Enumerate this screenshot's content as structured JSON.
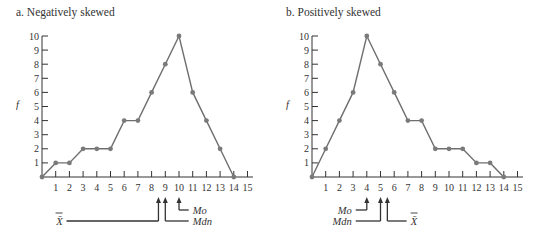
{
  "chart_data": [
    {
      "type": "line",
      "title": "a. Negatively skewed",
      "xlabel": "",
      "ylabel": "f",
      "x": [
        0,
        1,
        2,
        3,
        4,
        5,
        6,
        7,
        8,
        9,
        10,
        11,
        12,
        13,
        14
      ],
      "values": [
        0,
        1,
        1,
        2,
        2,
        2,
        4,
        4,
        6,
        8,
        10,
        6,
        4,
        2,
        0
      ],
      "xticks": [
        1,
        2,
        3,
        4,
        5,
        6,
        7,
        8,
        9,
        10,
        11,
        12,
        13,
        14,
        15
      ],
      "yticks": [
        1,
        2,
        3,
        4,
        5,
        6,
        7,
        8,
        9,
        10
      ],
      "xlim": [
        0,
        15
      ],
      "ylim": [
        0,
        10
      ],
      "grid": false,
      "annotations": [
        {
          "label": "X̄",
          "x": 8.5
        },
        {
          "label": "Mdn",
          "x": 9
        },
        {
          "label": "Mo",
          "x": 10
        }
      ]
    },
    {
      "type": "line",
      "title": "b. Positively skewed",
      "xlabel": "",
      "ylabel": "f",
      "x": [
        0,
        1,
        2,
        3,
        4,
        5,
        6,
        7,
        8,
        9,
        10,
        11,
        12,
        13,
        14
      ],
      "values": [
        0,
        2,
        4,
        6,
        10,
        8,
        6,
        4,
        4,
        2,
        2,
        2,
        1,
        1,
        0
      ],
      "xticks": [
        1,
        2,
        3,
        4,
        5,
        6,
        7,
        8,
        9,
        10,
        11,
        12,
        13,
        14,
        15
      ],
      "yticks": [
        1,
        2,
        3,
        4,
        5,
        6,
        7,
        8,
        9,
        10
      ],
      "xlim": [
        0,
        15
      ],
      "ylim": [
        0,
        10
      ],
      "grid": false,
      "annotations": [
        {
          "label": "Mo",
          "x": 4
        },
        {
          "label": "Mdn",
          "x": 5
        },
        {
          "label": "X̄",
          "x": 5.5
        }
      ]
    }
  ],
  "panels": {
    "left": {
      "title": "a. Negatively skewed",
      "ylabel": "f",
      "mean_label": "X̄",
      "median_label": "Mdn",
      "mode_label": "Mo"
    },
    "right": {
      "title": "b. Positively skewed",
      "ylabel": "f",
      "mean_label": "X̄",
      "median_label": "Mdn",
      "mode_label": "Mo"
    }
  },
  "style": {
    "line_color": "#6e6e6e",
    "point_color": "#7a7a7a",
    "axis_color": "#333333"
  }
}
